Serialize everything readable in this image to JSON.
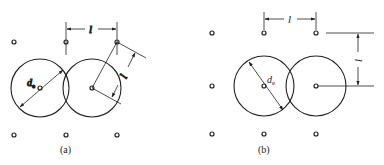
{
  "figure": {
    "panels": [
      {
        "id": "a",
        "caption": "(a)",
        "layout": "triangular",
        "spacing_label": "l",
        "diameter_label": "d",
        "diameter_subscript": "e",
        "pitch_label": "l"
      },
      {
        "id": "b",
        "caption": "(b)",
        "layout": "square",
        "spacing_label": "l",
        "diameter_label": "d",
        "diameter_subscript": "e",
        "pitch_label": "l"
      }
    ]
  }
}
